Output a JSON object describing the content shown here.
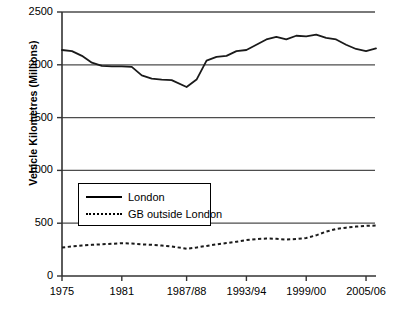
{
  "chart_data": {
    "type": "line",
    "title": "",
    "xlabel": "",
    "ylabel": "Vehicle Kilometres (Millions)",
    "ylim": [
      0,
      2500
    ],
    "yticks": [
      0,
      500,
      1000,
      1500,
      2000,
      2500
    ],
    "ytick_labels": [
      "0",
      "500",
      "1000",
      "1500",
      "2000",
      "2500"
    ],
    "xtick_labels": [
      "1975",
      "1981",
      "1987/88",
      "1993/94",
      "1999/00",
      "2005/06"
    ],
    "xtick_values": [
      1975,
      1981,
      1987.5,
      1993.5,
      1999.5,
      2005.5
    ],
    "xlim": [
      1975,
      2006.5
    ],
    "grid": "horizontal",
    "legend_position": "center-left",
    "series": [
      {
        "name": "London",
        "style": "solid",
        "color": "#1a1a1a",
        "x": [
          1975,
          1976,
          1977,
          1978,
          1979,
          1980,
          1981,
          1982,
          1983,
          1984,
          1985,
          1986,
          1987.5,
          1988.5,
          1989.5,
          1990.5,
          1991.5,
          1992.5,
          1993.5,
          1994.5,
          1995.5,
          1996.5,
          1997.5,
          1998.5,
          1999.5,
          2000.5,
          2001.5,
          2002.5,
          2003.5,
          2004.5,
          2005.5,
          2006.5
        ],
        "values": [
          2140,
          2130,
          2085,
          2020,
          1990,
          1985,
          1985,
          1980,
          1900,
          1870,
          1860,
          1855,
          1790,
          1860,
          2040,
          2075,
          2085,
          2130,
          2140,
          2190,
          2240,
          2265,
          2240,
          2275,
          2270,
          2285,
          2255,
          2240,
          2190,
          2150,
          2130,
          2155
        ]
      },
      {
        "name": "GB outside London",
        "style": "dotted",
        "color": "#1a1a1a",
        "x": [
          1975,
          1976,
          1977,
          1978,
          1979,
          1980,
          1981,
          1982,
          1983,
          1984,
          1985,
          1986,
          1987.5,
          1988.5,
          1989.5,
          1990.5,
          1991.5,
          1992.5,
          1993.5,
          1994.5,
          1995.5,
          1996.5,
          1997.5,
          1998.5,
          1999.5,
          2000.5,
          2001.5,
          2002.5,
          2003.5,
          2004.5,
          2005.5,
          2006.5
        ],
        "values": [
          270,
          280,
          288,
          295,
          300,
          305,
          310,
          308,
          300,
          295,
          288,
          280,
          258,
          270,
          285,
          300,
          312,
          325,
          340,
          350,
          355,
          352,
          345,
          350,
          360,
          385,
          420,
          445,
          458,
          468,
          475,
          478
        ]
      }
    ],
    "legend": [
      {
        "label": "London",
        "style": "solid"
      },
      {
        "label": "GB outside London",
        "style": "dotted"
      }
    ]
  }
}
